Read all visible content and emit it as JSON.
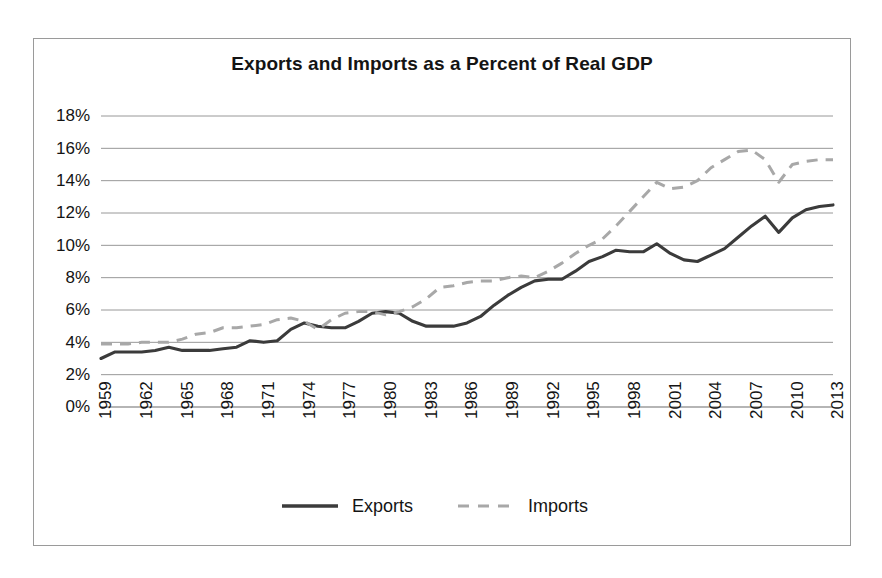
{
  "chart": {
    "title": "Exports and Imports as a Percent of Real GDP",
    "frame_border_color": "#9a9a9a",
    "background_color": "#ffffff"
  },
  "legend": {
    "position": "bottom",
    "exports_label": "Exports",
    "imports_label": "Imports"
  },
  "chart_data": {
    "type": "line",
    "title": "Exports and Imports as a Percent of Real GDP",
    "xlabel": "",
    "ylabel": "",
    "xlim": [
      1959,
      2013
    ],
    "ylim": [
      0,
      18
    ],
    "ytick_labels": [
      "18%",
      "16%",
      "14%",
      "12%",
      "10%",
      "8%",
      "6%",
      "4%",
      "2%",
      "0%"
    ],
    "ytick_values": [
      18,
      16,
      14,
      12,
      10,
      8,
      6,
      4,
      2,
      0
    ],
    "xtick_labels": [
      "1959",
      "1962",
      "1965",
      "1968",
      "1971",
      "1974",
      "1977",
      "1980",
      "1983",
      "1986",
      "1989",
      "1992",
      "1995",
      "1998",
      "2001",
      "2004",
      "2007",
      "2010",
      "2013"
    ],
    "xtick_values": [
      1959,
      1962,
      1965,
      1968,
      1971,
      1974,
      1977,
      1980,
      1983,
      1986,
      1989,
      1992,
      1995,
      1998,
      2001,
      2004,
      2007,
      2010,
      2013
    ],
    "grid": true,
    "grid_axis": "y",
    "x": [
      1959,
      1960,
      1961,
      1962,
      1963,
      1964,
      1965,
      1966,
      1967,
      1968,
      1969,
      1970,
      1971,
      1972,
      1973,
      1974,
      1975,
      1976,
      1977,
      1978,
      1979,
      1980,
      1981,
      1982,
      1983,
      1984,
      1985,
      1986,
      1987,
      1988,
      1989,
      1990,
      1991,
      1992,
      1993,
      1994,
      1995,
      1996,
      1997,
      1998,
      1999,
      2000,
      2001,
      2002,
      2003,
      2004,
      2005,
      2006,
      2007,
      2008,
      2009,
      2010,
      2011,
      2012,
      2013
    ],
    "series": [
      {
        "name": "Exports",
        "color": "#3b3b3b",
        "style": "solid",
        "values": [
          3.0,
          3.4,
          3.4,
          3.4,
          3.5,
          3.7,
          3.5,
          3.5,
          3.5,
          3.6,
          3.7,
          4.1,
          4.0,
          4.1,
          4.8,
          5.2,
          5.0,
          4.9,
          4.9,
          5.3,
          5.8,
          5.9,
          5.8,
          5.3,
          5.0,
          5.0,
          5.0,
          5.2,
          5.6,
          6.3,
          6.9,
          7.4,
          7.8,
          7.9,
          7.9,
          8.4,
          9.0,
          9.3,
          9.7,
          9.6,
          9.6,
          10.1,
          9.5,
          9.1,
          9.0,
          9.4,
          9.8,
          10.5,
          11.2,
          11.8,
          10.8,
          11.7,
          12.2,
          12.4,
          12.5
        ]
      },
      {
        "name": "Imports",
        "color": "#a8a8a8",
        "style": "dashed",
        "values": [
          3.9,
          3.9,
          3.9,
          4.0,
          4.0,
          4.0,
          4.2,
          4.5,
          4.6,
          4.9,
          4.9,
          5.0,
          5.1,
          5.4,
          5.5,
          5.3,
          4.8,
          5.4,
          5.8,
          5.9,
          5.9,
          5.7,
          5.9,
          6.2,
          6.7,
          7.4,
          7.5,
          7.7,
          7.8,
          7.8,
          8.0,
          8.1,
          8.0,
          8.4,
          8.9,
          9.5,
          10.0,
          10.4,
          11.2,
          12.1,
          13.0,
          13.9,
          13.5,
          13.6,
          14.0,
          14.8,
          15.3,
          15.8,
          15.9,
          15.3,
          13.9,
          15.0,
          15.2,
          15.3,
          15.3
        ]
      }
    ]
  }
}
